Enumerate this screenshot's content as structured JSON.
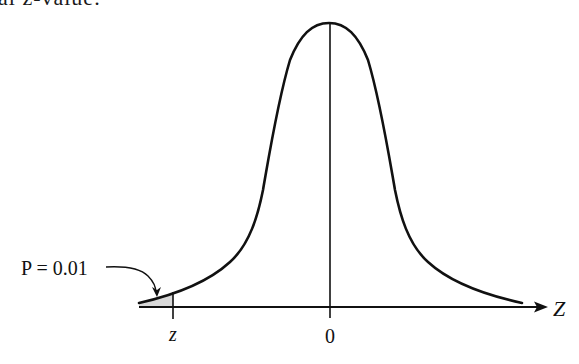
{
  "heading_fragment": "al z-value:",
  "diagram": {
    "type": "normal-distribution-curve",
    "annotation": "P = 0.01",
    "critical_value_label": "z",
    "center_label": "0",
    "axis_label": "Z",
    "shaded_region": "left tail",
    "colors": {
      "line": "#111111",
      "shade": "#d9d9d9"
    }
  }
}
